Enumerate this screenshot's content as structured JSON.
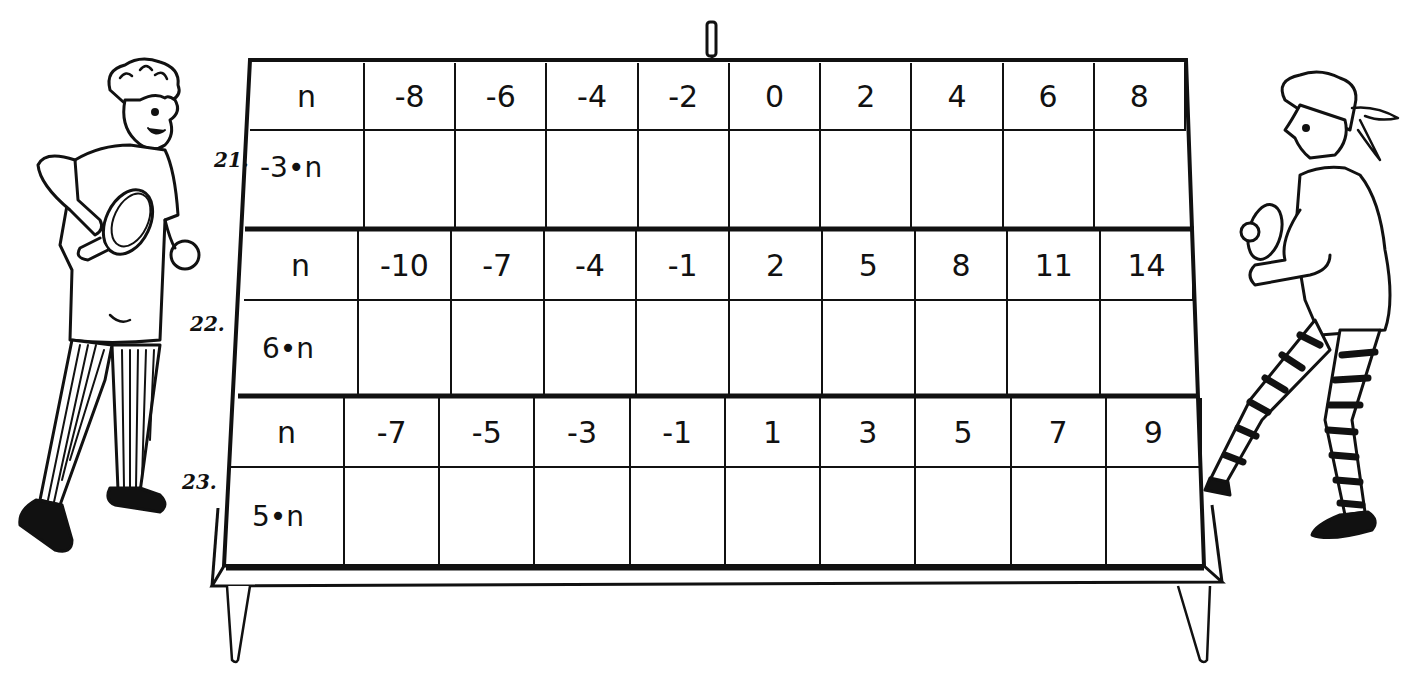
{
  "problems": [
    {
      "number": "21.",
      "header_label": "n",
      "n_values": [
        "-8",
        "-6",
        "-4",
        "-2",
        "0",
        "2",
        "4",
        "6",
        "8"
      ],
      "expression": "-3•n",
      "answers": [
        "",
        "",
        "",
        "",
        "",
        "",
        "",
        "",
        ""
      ]
    },
    {
      "number": "22.",
      "header_label": "n",
      "n_values": [
        "-10",
        "-7",
        "-4",
        "-1",
        "2",
        "5",
        "8",
        "11",
        "14"
      ],
      "expression": "6•n",
      "answers": [
        "",
        "",
        "",
        "",
        "",
        "",
        "",
        "",
        ""
      ]
    },
    {
      "number": "23.",
      "header_label": "n",
      "n_values": [
        "-7",
        "-5",
        "-3",
        "-1",
        "1",
        "3",
        "5",
        "7",
        "9"
      ],
      "expression": "5•n",
      "answers": [
        "",
        "",
        "",
        "",
        "",
        "",
        "",
        "",
        ""
      ]
    }
  ],
  "illustration": {
    "scene": "ping-pong-table",
    "left_player": "boy-with-paddle-striped-pants",
    "right_player": "girl-with-paddle-striped-tights"
  }
}
